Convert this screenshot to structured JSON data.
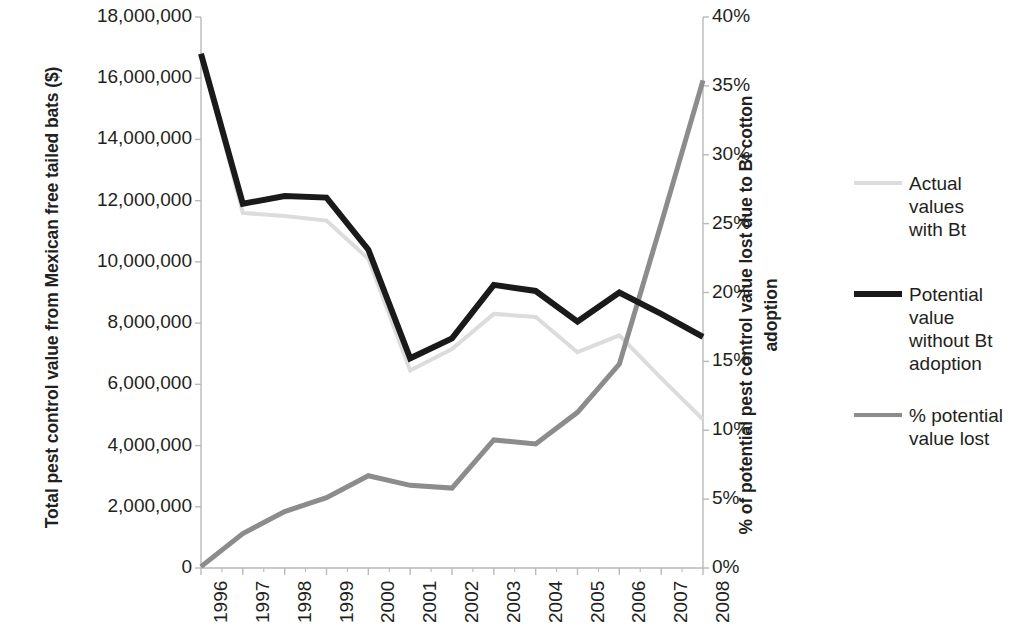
{
  "chart_data": {
    "type": "line",
    "title": "",
    "x": [
      1996,
      1997,
      1998,
      1999,
      2000,
      2001,
      2002,
      2003,
      2004,
      2005,
      2006,
      2007,
      2008
    ],
    "categories": [
      "1996",
      "1997",
      "1998",
      "1999",
      "2000",
      "2001",
      "2002",
      "2003",
      "2004",
      "2005",
      "2006",
      "2007",
      "2008"
    ],
    "xlabel": "",
    "ylabel": "Total pest control value from Mexican free tailed bats ($)",
    "y2label": "% of  potential pest control value lost due to Bt cotton adoption",
    "ylim": [
      0,
      18000000
    ],
    "y2lim": [
      0,
      0.4
    ],
    "yticks": [
      "0",
      "2,000,000",
      "4,000,000",
      "6,000,000",
      "8,000,000",
      "10,000,000",
      "12,000,000",
      "14,000,000",
      "16,000,000",
      "18,000,000"
    ],
    "ytick_values": [
      0,
      2000000,
      4000000,
      6000000,
      8000000,
      10000000,
      12000000,
      14000000,
      16000000,
      18000000
    ],
    "y2ticks": [
      "0%",
      "5%",
      "10%",
      "15%",
      "20%",
      "25%",
      "30%",
      "35%",
      "40%"
    ],
    "y2tick_values": [
      0,
      0.05,
      0.1,
      0.15,
      0.2,
      0.25,
      0.3,
      0.35,
      0.4
    ],
    "grid": false,
    "legend_position": "right",
    "series": [
      {
        "name": "Actual values with Bt",
        "axis": "left",
        "color": "#dcdcdc",
        "width": 4,
        "values": [
          16800000,
          11600000,
          11500000,
          11350000,
          10100000,
          6450000,
          7150000,
          8300000,
          8200000,
          7050000,
          7600000,
          6200000,
          4850000
        ]
      },
      {
        "name": "Potential value without Bt adoption",
        "axis": "left",
        "color": "#1a1a1a",
        "width": 6,
        "values": [
          16800000,
          11900000,
          12150000,
          12100000,
          10400000,
          6850000,
          7500000,
          9250000,
          9050000,
          8050000,
          9000000,
          8300000,
          7550000
        ]
      },
      {
        "name": "% potential value lost",
        "axis": "right",
        "color": "#8c8c8c",
        "width": 5,
        "values": [
          0.001,
          0.025,
          0.041,
          0.051,
          0.067,
          0.06,
          0.058,
          0.093,
          0.09,
          0.113,
          0.148,
          0.25,
          0.354
        ]
      }
    ]
  },
  "legend": {
    "items": [
      {
        "label": "Actual values\nwith Bt",
        "color": "#dcdcdc",
        "thick": false
      },
      {
        "label": "Potential value\nwithout Bt\nadoption",
        "color": "#1a1a1a",
        "thick": true
      },
      {
        "label": "% potential\nvalue lost",
        "color": "#8c8c8c",
        "thick": false
      }
    ]
  }
}
